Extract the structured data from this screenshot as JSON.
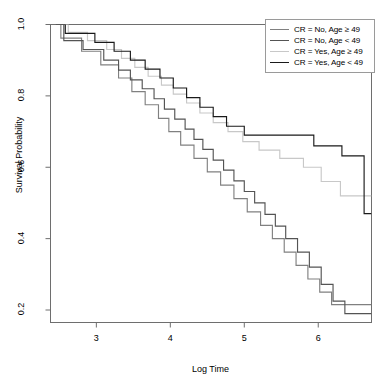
{
  "chart_data": {
    "type": "line",
    "title": "",
    "xlabel": "Log Time",
    "ylabel": "Survival Probability",
    "xlim": [
      2.38,
      6.72
    ],
    "ylim": [
      0.165,
      1.0
    ],
    "xticks": [
      3,
      4,
      5,
      6
    ],
    "yticks": [
      0.2,
      0.4,
      0.6,
      0.8,
      1.0
    ],
    "ytick_labels": [
      "0.2",
      "0.4",
      "0.6",
      "0.8",
      "1.0"
    ],
    "xtick_labels": [
      "3",
      "4",
      "5",
      "6"
    ],
    "grid": false,
    "step": "post",
    "legend_position": "top-right",
    "series": [
      {
        "name": "CR = No, Age ≥ 49",
        "color": "#808080",
        "points": [
          [
            2.45,
            1.0
          ],
          [
            2.52,
            0.962
          ],
          [
            2.72,
            0.962
          ],
          [
            2.8,
            0.925
          ],
          [
            3.0,
            0.925
          ],
          [
            3.06,
            0.887
          ],
          [
            3.24,
            0.887
          ],
          [
            3.3,
            0.85
          ],
          [
            3.42,
            0.85
          ],
          [
            3.48,
            0.812
          ],
          [
            3.6,
            0.812
          ],
          [
            3.66,
            0.775
          ],
          [
            3.78,
            0.775
          ],
          [
            3.84,
            0.737
          ],
          [
            3.92,
            0.737
          ],
          [
            3.98,
            0.7
          ],
          [
            4.08,
            0.7
          ],
          [
            4.14,
            0.662
          ],
          [
            4.26,
            0.662
          ],
          [
            4.32,
            0.625
          ],
          [
            4.44,
            0.625
          ],
          [
            4.5,
            0.587
          ],
          [
            4.62,
            0.587
          ],
          [
            4.68,
            0.55
          ],
          [
            4.8,
            0.55
          ],
          [
            4.86,
            0.512
          ],
          [
            4.98,
            0.512
          ],
          [
            5.04,
            0.475
          ],
          [
            5.16,
            0.475
          ],
          [
            5.22,
            0.437
          ],
          [
            5.32,
            0.437
          ],
          [
            5.38,
            0.4
          ],
          [
            5.48,
            0.4
          ],
          [
            5.54,
            0.362
          ],
          [
            5.64,
            0.362
          ],
          [
            5.7,
            0.325
          ],
          [
            5.8,
            0.325
          ],
          [
            5.86,
            0.287
          ],
          [
            5.96,
            0.287
          ],
          [
            6.02,
            0.25
          ],
          [
            6.12,
            0.25
          ],
          [
            6.18,
            0.215
          ],
          [
            6.72,
            0.215
          ]
        ]
      },
      {
        "name": "CR = No, Age < 49",
        "color": "#545454",
        "points": [
          [
            2.45,
            1.0
          ],
          [
            2.56,
            0.955
          ],
          [
            2.74,
            0.955
          ],
          [
            2.82,
            0.93
          ],
          [
            3.02,
            0.93
          ],
          [
            3.1,
            0.9
          ],
          [
            3.22,
            0.9
          ],
          [
            3.3,
            0.872
          ],
          [
            3.4,
            0.872
          ],
          [
            3.46,
            0.845
          ],
          [
            3.56,
            0.845
          ],
          [
            3.62,
            0.82
          ],
          [
            3.72,
            0.82
          ],
          [
            3.78,
            0.792
          ],
          [
            3.86,
            0.792
          ],
          [
            3.92,
            0.763
          ],
          [
            4.0,
            0.763
          ],
          [
            4.06,
            0.735
          ],
          [
            4.14,
            0.735
          ],
          [
            4.2,
            0.707
          ],
          [
            4.26,
            0.707
          ],
          [
            4.32,
            0.678
          ],
          [
            4.38,
            0.678
          ],
          [
            4.44,
            0.65
          ],
          [
            4.52,
            0.65
          ],
          [
            4.58,
            0.62
          ],
          [
            4.66,
            0.62
          ],
          [
            4.72,
            0.592
          ],
          [
            4.8,
            0.592
          ],
          [
            4.86,
            0.562
          ],
          [
            4.94,
            0.562
          ],
          [
            5.0,
            0.532
          ],
          [
            5.08,
            0.532
          ],
          [
            5.14,
            0.5
          ],
          [
            5.22,
            0.5
          ],
          [
            5.28,
            0.468
          ],
          [
            5.36,
            0.468
          ],
          [
            5.42,
            0.435
          ],
          [
            5.5,
            0.435
          ],
          [
            5.56,
            0.4
          ],
          [
            5.66,
            0.4
          ],
          [
            5.72,
            0.362
          ],
          [
            5.82,
            0.362
          ],
          [
            5.88,
            0.32
          ],
          [
            5.98,
            0.32
          ],
          [
            6.04,
            0.272
          ],
          [
            6.14,
            0.272
          ],
          [
            6.2,
            0.225
          ],
          [
            6.3,
            0.225
          ],
          [
            6.36,
            0.19
          ],
          [
            6.72,
            0.19
          ]
        ]
      },
      {
        "name": "CR = Yes, Age ≥ 49",
        "color": "#c8c8c8",
        "points": [
          [
            2.45,
            1.0
          ],
          [
            2.62,
            0.978
          ],
          [
            2.8,
            0.978
          ],
          [
            2.88,
            0.955
          ],
          [
            3.06,
            0.955
          ],
          [
            3.14,
            0.93
          ],
          [
            3.26,
            0.93
          ],
          [
            3.34,
            0.905
          ],
          [
            3.44,
            0.905
          ],
          [
            3.52,
            0.88
          ],
          [
            3.62,
            0.88
          ],
          [
            3.7,
            0.855
          ],
          [
            3.8,
            0.855
          ],
          [
            3.88,
            0.83
          ],
          [
            3.96,
            0.83
          ],
          [
            4.04,
            0.805
          ],
          [
            4.14,
            0.805
          ],
          [
            4.22,
            0.78
          ],
          [
            4.32,
            0.78
          ],
          [
            4.4,
            0.752
          ],
          [
            4.5,
            0.752
          ],
          [
            4.58,
            0.725
          ],
          [
            4.7,
            0.725
          ],
          [
            4.78,
            0.7
          ],
          [
            4.9,
            0.7
          ],
          [
            4.98,
            0.672
          ],
          [
            5.12,
            0.672
          ],
          [
            5.2,
            0.648
          ],
          [
            5.4,
            0.648
          ],
          [
            5.48,
            0.625
          ],
          [
            5.72,
            0.625
          ],
          [
            5.8,
            0.6
          ],
          [
            5.96,
            0.6
          ],
          [
            6.04,
            0.56
          ],
          [
            6.22,
            0.56
          ],
          [
            6.3,
            0.52
          ],
          [
            6.72,
            0.52
          ]
        ]
      },
      {
        "name": "CR = Yes, Age < 49",
        "color": "#1a1a1a",
        "points": [
          [
            2.45,
            1.0
          ],
          [
            2.58,
            0.975
          ],
          [
            2.9,
            0.975
          ],
          [
            2.98,
            0.95
          ],
          [
            3.16,
            0.95
          ],
          [
            3.24,
            0.925
          ],
          [
            3.38,
            0.925
          ],
          [
            3.46,
            0.9
          ],
          [
            3.58,
            0.9
          ],
          [
            3.66,
            0.875
          ],
          [
            3.78,
            0.875
          ],
          [
            3.86,
            0.85
          ],
          [
            3.96,
            0.85
          ],
          [
            4.04,
            0.822
          ],
          [
            4.14,
            0.822
          ],
          [
            4.22,
            0.795
          ],
          [
            4.32,
            0.795
          ],
          [
            4.4,
            0.768
          ],
          [
            4.5,
            0.768
          ],
          [
            4.58,
            0.742
          ],
          [
            4.68,
            0.742
          ],
          [
            4.76,
            0.715
          ],
          [
            4.92,
            0.715
          ],
          [
            5.0,
            0.69
          ],
          [
            5.86,
            0.69
          ],
          [
            5.94,
            0.66
          ],
          [
            6.24,
            0.66
          ],
          [
            6.32,
            0.632
          ],
          [
            6.56,
            0.632
          ],
          [
            6.62,
            0.47
          ],
          [
            6.72,
            0.47
          ]
        ]
      }
    ]
  },
  "legend": {
    "entries": [
      {
        "label": "CR = No, Age ≥ 49",
        "color": "#808080"
      },
      {
        "label": "CR = No, Age < 49",
        "color": "#545454"
      },
      {
        "label": "CR = Yes, Age ≥ 49",
        "color": "#c8c8c8"
      },
      {
        "label": "CR = Yes, Age < 49",
        "color": "#1a1a1a"
      }
    ]
  }
}
